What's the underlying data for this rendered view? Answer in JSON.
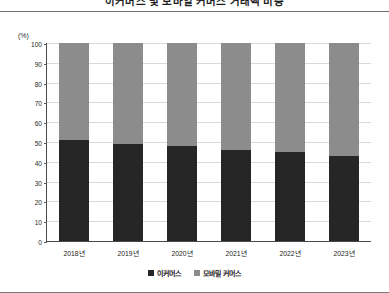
{
  "chart_data": {
    "type": "bar",
    "stacked": true,
    "stack_mode": "percent",
    "title": "이커머스 및 모바일 커머스 거래액 비중",
    "unit_label": "(%)",
    "xlabel": "",
    "ylabel": "",
    "ylim": [
      0,
      100
    ],
    "ytick_step": 10,
    "yticks": [
      100,
      90,
      80,
      70,
      60,
      50,
      40,
      30,
      20,
      10,
      0
    ],
    "grid": true,
    "legend_position": "bottom",
    "categories": [
      "2018년",
      "2019년",
      "2020년",
      "2021년",
      "2022년",
      "2023년"
    ],
    "series": [
      {
        "name": "이커머스",
        "color": "#262626",
        "values": [
          51,
          49,
          48,
          46,
          45,
          43
        ]
      },
      {
        "name": "모바일 커머스",
        "color": "#8c8c8c",
        "values": [
          49,
          51,
          52,
          54,
          55,
          57
        ]
      }
    ]
  },
  "colors": {
    "ecommerce": "#262626",
    "mobile_commerce": "#8c8c8c",
    "axis": "#4a4a4a",
    "grid": "#d9d9d9",
    "rule": "#6e6e6e"
  }
}
